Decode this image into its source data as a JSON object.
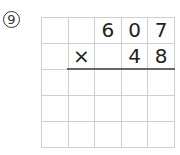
{
  "problem": {
    "number_label": "9",
    "operator": "×",
    "multiplicand": [
      "",
      "",
      "6",
      "0",
      "7"
    ],
    "multiplier_row": [
      "",
      "×",
      "",
      "4",
      "8"
    ],
    "rows": [
      [
        "",
        "",
        "6",
        "0",
        "7"
      ],
      [
        "",
        "×",
        "",
        "4",
        "8"
      ],
      [
        "",
        "",
        "",
        "",
        ""
      ],
      [
        "",
        "",
        "",
        "",
        ""
      ],
      [
        "",
        "",
        "",
        "",
        ""
      ]
    ]
  }
}
